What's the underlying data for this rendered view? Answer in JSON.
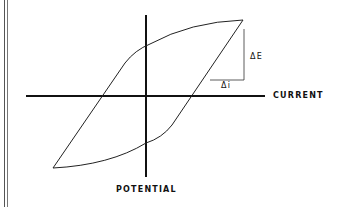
{
  "diagram": {
    "type": "hysteresis loop",
    "x_axis_label": "CURRENT",
    "y_axis_label": "POTENTIAL",
    "delta_e_label": "ΔE",
    "delta_i_label": "Δi"
  }
}
